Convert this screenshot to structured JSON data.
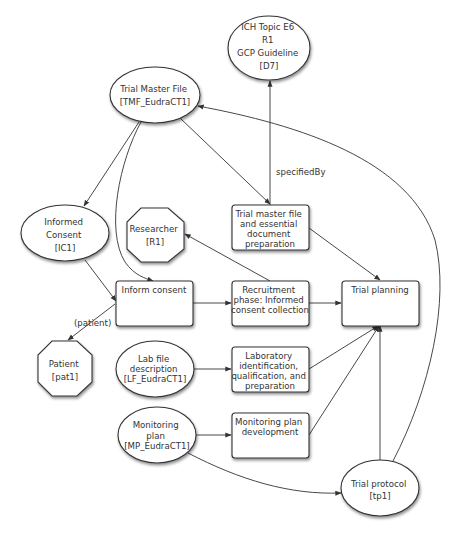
{
  "diagram": {
    "nodes": {
      "ich": {
        "lines": [
          "ICH Topic E6",
          "R1",
          "GCP Guideline",
          "[D7]"
        ],
        "shape": "ellipse"
      },
      "tmf": {
        "lines": [
          "Trial Master File",
          "[TMF_EudraCT1]"
        ],
        "shape": "ellipse"
      },
      "informed_consent": {
        "lines": [
          "Informed",
          "Consent",
          "[IC1]"
        ],
        "shape": "ellipse"
      },
      "researcher": {
        "lines": [
          "Researcher",
          "[R1]"
        ],
        "shape": "octagon"
      },
      "patient": {
        "lines": [
          "Patient",
          "[pat1]"
        ],
        "shape": "octagon"
      },
      "lab_file": {
        "lines": [
          "Lab file",
          "description",
          "[LF_EudraCT1]"
        ],
        "shape": "ellipse"
      },
      "monitoring_plan": {
        "lines": [
          "Monitoring",
          "plan",
          "[MP_EudraCT1]"
        ],
        "shape": "ellipse"
      },
      "trial_protocol": {
        "lines": [
          "Trial protocol",
          "[tp1]"
        ],
        "shape": "ellipse"
      },
      "inform_consent_act": {
        "lines": [
          "Inform consent"
        ],
        "shape": "box"
      },
      "tmf_prep_act": {
        "lines": [
          "Trial master file",
          "and essential",
          "document",
          "preparation"
        ],
        "shape": "box"
      },
      "recruitment_act": {
        "lines": [
          "Recruitment",
          "phase: Informed",
          "consent collection"
        ],
        "shape": "box"
      },
      "trial_planning_act": {
        "lines": [
          "Trial planning"
        ],
        "shape": "box"
      },
      "lab_act": {
        "lines": [
          "Laboratory",
          "identification,",
          "qualification, and",
          "preparation"
        ],
        "shape": "box"
      },
      "monitoring_dev_act": {
        "lines": [
          "Monitoring plan",
          "development"
        ],
        "shape": "box"
      }
    },
    "edge_labels": {
      "specified_by": "specifiedBy",
      "patient_role": "(patient)"
    },
    "edges": [
      {
        "from": "tmf_prep_act",
        "to": "ich",
        "label": "specifiedBy"
      },
      {
        "from": "tmf",
        "to": "tmf_prep_act"
      },
      {
        "from": "tmf",
        "to": "informed_consent"
      },
      {
        "from": "tmf",
        "to": "inform_consent_act"
      },
      {
        "from": "trial_protocol",
        "to": "tmf"
      },
      {
        "from": "informed_consent",
        "to": "inform_consent_act"
      },
      {
        "from": "inform_consent_act",
        "to": "patient",
        "label": "(patient)"
      },
      {
        "from": "inform_consent_act",
        "to": "recruitment_act"
      },
      {
        "from": "recruitment_act",
        "to": "researcher"
      },
      {
        "from": "recruitment_act",
        "to": "trial_planning_act"
      },
      {
        "from": "tmf_prep_act",
        "to": "trial_planning_act"
      },
      {
        "from": "lab_file",
        "to": "lab_act"
      },
      {
        "from": "lab_act",
        "to": "trial_planning_act"
      },
      {
        "from": "monitoring_plan",
        "to": "monitoring_dev_act"
      },
      {
        "from": "monitoring_dev_act",
        "to": "trial_planning_act"
      },
      {
        "from": "monitoring_plan",
        "to": "trial_protocol"
      },
      {
        "from": "trial_protocol",
        "to": "trial_planning_act"
      }
    ],
    "colors": {
      "stroke": "#333333",
      "fill": "#ffffff",
      "text": "#333333"
    }
  }
}
